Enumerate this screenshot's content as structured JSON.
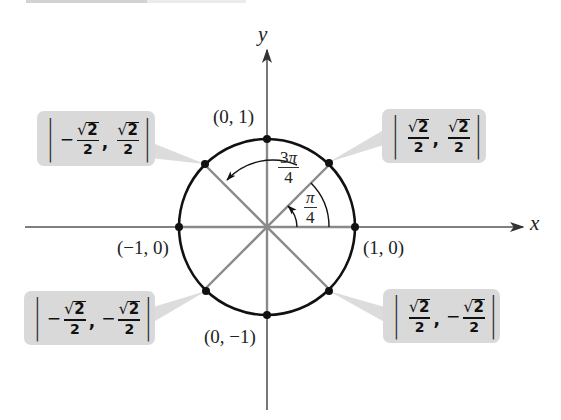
{
  "diagram": {
    "type": "unit-circle",
    "center_px": [
      267,
      227
    ],
    "radius_px": 88,
    "colors": {
      "circle": "#111111",
      "axes": "#555555",
      "radii": "#8a8a8a",
      "points": "#111111",
      "callout_box": "#d9d9d9",
      "callout_pointer": "#dcdcdc",
      "text": "#222222"
    },
    "axes": {
      "x_label": "x",
      "y_label": "y"
    },
    "axis_points": {
      "top": "(0, 1)",
      "left": "(−1, 0)",
      "right": "(1, 0)",
      "bottom": "(0, −1)"
    },
    "angles": [
      {
        "id": "pi_over_4",
        "numerator": "π",
        "denominator": "4",
        "degrees": 45
      },
      {
        "id": "three_pi_over_4",
        "numerator_coef": "3",
        "numerator_sym": "π",
        "denominator": "4",
        "degrees": 135
      }
    ],
    "callouts": {
      "q1": {
        "x_sign": "",
        "x_num": "2",
        "x_den": "2",
        "y_sign": "",
        "y_num": "2",
        "y_den": "2",
        "radical": "√",
        "comma": ","
      },
      "q2": {
        "x_sign": "−",
        "x_num": "2",
        "x_den": "2",
        "y_sign": "",
        "y_num": "2",
        "y_den": "2",
        "radical": "√",
        "comma": ","
      },
      "q3": {
        "x_sign": "−",
        "x_num": "2",
        "x_den": "2",
        "y_sign": "−",
        "y_num": "2",
        "y_den": "2",
        "radical": "√",
        "comma": ","
      },
      "q4": {
        "x_sign": "",
        "x_num": "2",
        "x_den": "2",
        "y_sign": "−",
        "y_num": "2",
        "y_den": "2",
        "radical": "√",
        "comma": ","
      }
    }
  }
}
